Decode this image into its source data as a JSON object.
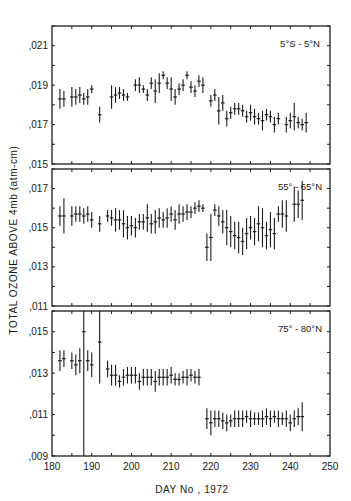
{
  "figure": {
    "ylabel": "TOTAL OZONE ABOVE 4mb (atm-cm)",
    "xlabel": "DAY No , 1972",
    "x_ticks": [
      "180",
      "190",
      "200",
      "210",
      "220",
      "230",
      "240",
      "250"
    ]
  },
  "chart_data": [
    {
      "type": "scatter",
      "title": "5°S - 5°N",
      "xlabel": "DAY No , 1972",
      "ylabel": "TOTAL OZONE ABOVE 4mb (atm-cm)",
      "xlim": [
        180,
        250
      ],
      "ylim": [
        0.015,
        0.022
      ],
      "y_tick_labels": [
        ",021",
        ",019",
        ",017",
        ",015"
      ],
      "y_ticks": [
        0.021,
        0.019,
        0.017,
        0.015
      ],
      "error_bars": true,
      "points": [
        {
          "x": 182,
          "y": 0.0183,
          "err": 0.0005
        },
        {
          "x": 183,
          "y": 0.0183,
          "err": 0.0004
        },
        {
          "x": 185,
          "y": 0.0184,
          "err": 0.0005
        },
        {
          "x": 186,
          "y": 0.0184,
          "err": 0.0004
        },
        {
          "x": 187,
          "y": 0.0185,
          "err": 0.0004
        },
        {
          "x": 188,
          "y": 0.0183,
          "err": 0.0003
        },
        {
          "x": 189,
          "y": 0.0184,
          "err": 0.0004
        },
        {
          "x": 190,
          "y": 0.0188,
          "err": 0.0002
        },
        {
          "x": 192,
          "y": 0.0175,
          "err": 0.0004
        },
        {
          "x": 195,
          "y": 0.0184,
          "err": 0.0006
        },
        {
          "x": 196,
          "y": 0.0185,
          "err": 0.0004
        },
        {
          "x": 197,
          "y": 0.0186,
          "err": 0.0003
        },
        {
          "x": 198,
          "y": 0.0185,
          "err": 0.0003
        },
        {
          "x": 199,
          "y": 0.0184,
          "err": 0.0002
        },
        {
          "x": 201,
          "y": 0.019,
          "err": 0.0003
        },
        {
          "x": 202,
          "y": 0.019,
          "err": 0.0004
        },
        {
          "x": 203,
          "y": 0.0188,
          "err": 0.0002
        },
        {
          "x": 204,
          "y": 0.0185,
          "err": 0.0003
        },
        {
          "x": 205,
          "y": 0.0191,
          "err": 0.0003
        },
        {
          "x": 206,
          "y": 0.0187,
          "err": 0.0006
        },
        {
          "x": 207,
          "y": 0.0191,
          "err": 0.0005
        },
        {
          "x": 208,
          "y": 0.0195,
          "err": 0.0002
        },
        {
          "x": 209,
          "y": 0.0191,
          "err": 0.0003
        },
        {
          "x": 210,
          "y": 0.0188,
          "err": 0.0006
        },
        {
          "x": 211,
          "y": 0.0184,
          "err": 0.0004
        },
        {
          "x": 212,
          "y": 0.0188,
          "err": 0.0003
        },
        {
          "x": 213,
          "y": 0.019,
          "err": 0.0003
        },
        {
          "x": 214,
          "y": 0.0195,
          "err": 0.0002
        },
        {
          "x": 215,
          "y": 0.0189,
          "err": 0.0003
        },
        {
          "x": 216,
          "y": 0.0187,
          "err": 0.0003
        },
        {
          "x": 217,
          "y": 0.0192,
          "err": 0.0003
        },
        {
          "x": 218,
          "y": 0.019,
          "err": 0.0004
        },
        {
          "x": 220,
          "y": 0.0182,
          "err": 0.0003
        },
        {
          "x": 221,
          "y": 0.0185,
          "err": 0.0003
        },
        {
          "x": 222,
          "y": 0.0177,
          "err": 0.0007
        },
        {
          "x": 223,
          "y": 0.0181,
          "err": 0.0004
        },
        {
          "x": 224,
          "y": 0.0173,
          "err": 0.0004
        },
        {
          "x": 225,
          "y": 0.0176,
          "err": 0.0003
        },
        {
          "x": 226,
          "y": 0.0178,
          "err": 0.0003
        },
        {
          "x": 227,
          "y": 0.0178,
          "err": 0.0003
        },
        {
          "x": 228,
          "y": 0.0177,
          "err": 0.0003
        },
        {
          "x": 229,
          "y": 0.0174,
          "err": 0.0003
        },
        {
          "x": 230,
          "y": 0.0176,
          "err": 0.0004
        },
        {
          "x": 231,
          "y": 0.0174,
          "err": 0.0004
        },
        {
          "x": 232,
          "y": 0.0173,
          "err": 0.0003
        },
        {
          "x": 233,
          "y": 0.0172,
          "err": 0.0005
        },
        {
          "x": 234,
          "y": 0.0175,
          "err": 0.0003
        },
        {
          "x": 235,
          "y": 0.0174,
          "err": 0.0003
        },
        {
          "x": 236,
          "y": 0.017,
          "err": 0.0004
        },
        {
          "x": 237,
          "y": 0.0173,
          "err": 0.0003
        },
        {
          "x": 239,
          "y": 0.017,
          "err": 0.0004
        },
        {
          "x": 240,
          "y": 0.0172,
          "err": 0.0004
        },
        {
          "x": 241,
          "y": 0.0174,
          "err": 0.0007
        },
        {
          "x": 242,
          "y": 0.0171,
          "err": 0.0003
        },
        {
          "x": 243,
          "y": 0.017,
          "err": 0.0003
        },
        {
          "x": 244,
          "y": 0.0171,
          "err": 0.0005
        }
      ]
    },
    {
      "type": "scatter",
      "title": "55° - 65°N",
      "xlabel": "DAY No , 1972",
      "ylabel": "TOTAL OZONE ABOVE 4mb (atm-cm)",
      "xlim": [
        180,
        250
      ],
      "ylim": [
        0.011,
        0.018
      ],
      "y_tick_labels": [
        ",017",
        ",015",
        ",013",
        ",011"
      ],
      "y_ticks": [
        0.017,
        0.015,
        0.013,
        0.011
      ],
      "error_bars": true,
      "points": [
        {
          "x": 182,
          "y": 0.0156,
          "err": 0.0005
        },
        {
          "x": 183,
          "y": 0.0156,
          "err": 0.0009
        },
        {
          "x": 185,
          "y": 0.0156,
          "err": 0.0005
        },
        {
          "x": 186,
          "y": 0.0157,
          "err": 0.0004
        },
        {
          "x": 187,
          "y": 0.0157,
          "err": 0.0004
        },
        {
          "x": 188,
          "y": 0.0156,
          "err": 0.0004
        },
        {
          "x": 189,
          "y": 0.0157,
          "err": 0.0004
        },
        {
          "x": 190,
          "y": 0.0154,
          "err": 0.0004
        },
        {
          "x": 192,
          "y": 0.0152,
          "err": 0.0004
        },
        {
          "x": 194,
          "y": 0.0156,
          "err": 0.0003
        },
        {
          "x": 195,
          "y": 0.0155,
          "err": 0.0004
        },
        {
          "x": 196,
          "y": 0.0154,
          "err": 0.0006
        },
        {
          "x": 197,
          "y": 0.0154,
          "err": 0.0005
        },
        {
          "x": 198,
          "y": 0.0152,
          "err": 0.0007
        },
        {
          "x": 199,
          "y": 0.015,
          "err": 0.0006
        },
        {
          "x": 200,
          "y": 0.0151,
          "err": 0.0005
        },
        {
          "x": 201,
          "y": 0.015,
          "err": 0.0005
        },
        {
          "x": 202,
          "y": 0.0153,
          "err": 0.0004
        },
        {
          "x": 203,
          "y": 0.0153,
          "err": 0.0004
        },
        {
          "x": 204,
          "y": 0.0155,
          "err": 0.0007
        },
        {
          "x": 205,
          "y": 0.0152,
          "err": 0.0005
        },
        {
          "x": 206,
          "y": 0.0153,
          "err": 0.0006
        },
        {
          "x": 207,
          "y": 0.0155,
          "err": 0.0005
        },
        {
          "x": 208,
          "y": 0.0154,
          "err": 0.0004
        },
        {
          "x": 209,
          "y": 0.0155,
          "err": 0.0005
        },
        {
          "x": 210,
          "y": 0.0157,
          "err": 0.0004
        },
        {
          "x": 211,
          "y": 0.0154,
          "err": 0.0005
        },
        {
          "x": 212,
          "y": 0.0157,
          "err": 0.0005
        },
        {
          "x": 213,
          "y": 0.0157,
          "err": 0.0004
        },
        {
          "x": 214,
          "y": 0.0158,
          "err": 0.0004
        },
        {
          "x": 215,
          "y": 0.0158,
          "err": 0.0003
        },
        {
          "x": 216,
          "y": 0.016,
          "err": 0.0003
        },
        {
          "x": 217,
          "y": 0.0161,
          "err": 0.0003
        },
        {
          "x": 218,
          "y": 0.016,
          "err": 0.0002
        },
        {
          "x": 219,
          "y": 0.014,
          "err": 0.0007
        },
        {
          "x": 220,
          "y": 0.0145,
          "err": 0.0012
        },
        {
          "x": 221,
          "y": 0.0159,
          "err": 0.0003
        },
        {
          "x": 222,
          "y": 0.0156,
          "err": 0.0005
        },
        {
          "x": 223,
          "y": 0.0153,
          "err": 0.0006
        },
        {
          "x": 224,
          "y": 0.015,
          "err": 0.0009
        },
        {
          "x": 225,
          "y": 0.0148,
          "err": 0.0008
        },
        {
          "x": 226,
          "y": 0.0146,
          "err": 0.0007
        },
        {
          "x": 227,
          "y": 0.0145,
          "err": 0.0008
        },
        {
          "x": 228,
          "y": 0.0143,
          "err": 0.0007
        },
        {
          "x": 229,
          "y": 0.0147,
          "err": 0.0008
        },
        {
          "x": 230,
          "y": 0.015,
          "err": 0.0006
        },
        {
          "x": 231,
          "y": 0.0148,
          "err": 0.0007
        },
        {
          "x": 232,
          "y": 0.0152,
          "err": 0.0009
        },
        {
          "x": 233,
          "y": 0.015,
          "err": 0.001
        },
        {
          "x": 234,
          "y": 0.0146,
          "err": 0.0007
        },
        {
          "x": 235,
          "y": 0.0149,
          "err": 0.0009
        },
        {
          "x": 236,
          "y": 0.0147,
          "err": 0.0008
        },
        {
          "x": 237,
          "y": 0.0157,
          "err": 0.0004
        },
        {
          "x": 238,
          "y": 0.0157,
          "err": 0.0007
        },
        {
          "x": 239,
          "y": 0.0156,
          "err": 0.0008
        },
        {
          "x": 241,
          "y": 0.0162,
          "err": 0.0009
        },
        {
          "x": 242,
          "y": 0.0162,
          "err": 0.0007
        },
        {
          "x": 243,
          "y": 0.0164,
          "err": 0.001
        }
      ]
    },
    {
      "type": "scatter",
      "title": "75° - 80°N",
      "xlabel": "DAY No , 1972",
      "ylabel": "TOTAL OZONE ABOVE 4mb (atm-cm)",
      "xlim": [
        180,
        250
      ],
      "ylim": [
        0.009,
        0.016
      ],
      "y_tick_labels": [
        ",015",
        ",013",
        ",011",
        ",009"
      ],
      "y_ticks": [
        0.015,
        0.013,
        0.011,
        0.009
      ],
      "error_bars": true,
      "points": [
        {
          "x": 182,
          "y": 0.0136,
          "err": 0.0005
        },
        {
          "x": 183,
          "y": 0.0137,
          "err": 0.0004
        },
        {
          "x": 185,
          "y": 0.0136,
          "err": 0.0004
        },
        {
          "x": 186,
          "y": 0.0134,
          "err": 0.0005
        },
        {
          "x": 187,
          "y": 0.0136,
          "err": 0.0006
        },
        {
          "x": 188,
          "y": 0.015,
          "err": 0.007
        },
        {
          "x": 189,
          "y": 0.0136,
          "err": 0.0005
        },
        {
          "x": 190,
          "y": 0.0134,
          "err": 0.0006
        },
        {
          "x": 192,
          "y": 0.0145,
          "err": 0.002
        },
        {
          "x": 194,
          "y": 0.0132,
          "err": 0.0004
        },
        {
          "x": 195,
          "y": 0.0129,
          "err": 0.0005
        },
        {
          "x": 196,
          "y": 0.0129,
          "err": 0.0005
        },
        {
          "x": 197,
          "y": 0.0126,
          "err": 0.0003
        },
        {
          "x": 198,
          "y": 0.0128,
          "err": 0.0004
        },
        {
          "x": 199,
          "y": 0.0129,
          "err": 0.0004
        },
        {
          "x": 200,
          "y": 0.0129,
          "err": 0.0004
        },
        {
          "x": 201,
          "y": 0.0129,
          "err": 0.0004
        },
        {
          "x": 202,
          "y": 0.0126,
          "err": 0.0004
        },
        {
          "x": 203,
          "y": 0.0128,
          "err": 0.0004
        },
        {
          "x": 204,
          "y": 0.0128,
          "err": 0.0004
        },
        {
          "x": 205,
          "y": 0.0128,
          "err": 0.0004
        },
        {
          "x": 206,
          "y": 0.0126,
          "err": 0.0005
        },
        {
          "x": 207,
          "y": 0.0128,
          "err": 0.0004
        },
        {
          "x": 208,
          "y": 0.0128,
          "err": 0.0004
        },
        {
          "x": 209,
          "y": 0.0128,
          "err": 0.0004
        },
        {
          "x": 210,
          "y": 0.0129,
          "err": 0.0004
        },
        {
          "x": 211,
          "y": 0.0127,
          "err": 0.0003
        },
        {
          "x": 212,
          "y": 0.0127,
          "err": 0.0003
        },
        {
          "x": 213,
          "y": 0.0128,
          "err": 0.0003
        },
        {
          "x": 214,
          "y": 0.0128,
          "err": 0.0004
        },
        {
          "x": 215,
          "y": 0.0129,
          "err": 0.0003
        },
        {
          "x": 216,
          "y": 0.0128,
          "err": 0.0003
        },
        {
          "x": 217,
          "y": 0.0128,
          "err": 0.0004
        },
        {
          "x": 219,
          "y": 0.0108,
          "err": 0.0005
        },
        {
          "x": 220,
          "y": 0.0106,
          "err": 0.0006
        },
        {
          "x": 221,
          "y": 0.0108,
          "err": 0.0004
        },
        {
          "x": 222,
          "y": 0.0108,
          "err": 0.0004
        },
        {
          "x": 223,
          "y": 0.0107,
          "err": 0.0004
        },
        {
          "x": 224,
          "y": 0.0106,
          "err": 0.0004
        },
        {
          "x": 225,
          "y": 0.0107,
          "err": 0.0003
        },
        {
          "x": 226,
          "y": 0.0108,
          "err": 0.0004
        },
        {
          "x": 227,
          "y": 0.0108,
          "err": 0.0004
        },
        {
          "x": 228,
          "y": 0.0108,
          "err": 0.0004
        },
        {
          "x": 229,
          "y": 0.0109,
          "err": 0.0003
        },
        {
          "x": 230,
          "y": 0.0108,
          "err": 0.0004
        },
        {
          "x": 231,
          "y": 0.0108,
          "err": 0.0003
        },
        {
          "x": 232,
          "y": 0.0108,
          "err": 0.0003
        },
        {
          "x": 233,
          "y": 0.0108,
          "err": 0.0004
        },
        {
          "x": 234,
          "y": 0.0109,
          "err": 0.0004
        },
        {
          "x": 235,
          "y": 0.0108,
          "err": 0.0004
        },
        {
          "x": 236,
          "y": 0.0109,
          "err": 0.0003
        },
        {
          "x": 237,
          "y": 0.0108,
          "err": 0.0004
        },
        {
          "x": 238,
          "y": 0.0108,
          "err": 0.0003
        },
        {
          "x": 239,
          "y": 0.0108,
          "err": 0.0004
        },
        {
          "x": 240,
          "y": 0.0106,
          "err": 0.0004
        },
        {
          "x": 241,
          "y": 0.0108,
          "err": 0.0004
        },
        {
          "x": 242,
          "y": 0.0109,
          "err": 0.0004
        },
        {
          "x": 243,
          "y": 0.0109,
          "err": 0.0007
        }
      ]
    }
  ]
}
